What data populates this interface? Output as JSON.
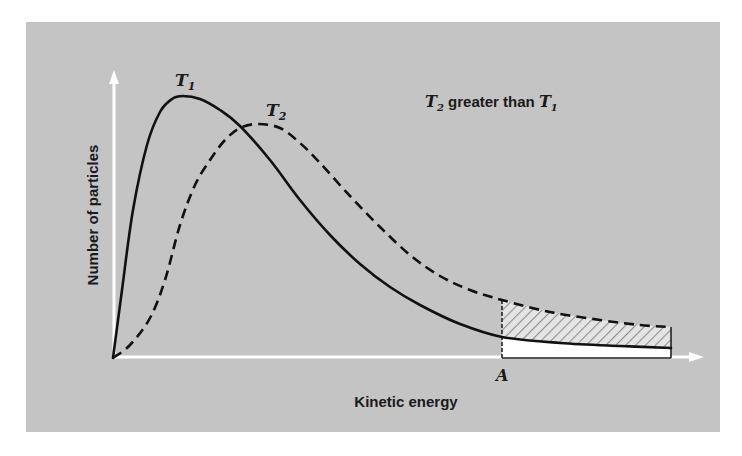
{
  "chart_data": {
    "type": "line",
    "title": "",
    "xlabel": "Kinetic energy",
    "ylabel": "Number of particles",
    "annotation": {
      "t2_label": "T",
      "t2_sub": "2",
      "middle": " greater than ",
      "t1_label": "T",
      "t1_sub": "1"
    },
    "x_marker": {
      "label": "A",
      "description": "Energy threshold; shaded region to the right shows extra high-energy particles at T2"
    },
    "grid": false,
    "legend": "inline labels on curves",
    "axis_ticks": "none",
    "background_color": "#c4c4c4",
    "series": [
      {
        "name": "T1",
        "label_main": "T",
        "label_sub": "1",
        "style": "solid",
        "color": "#111111",
        "points_px": [
          [
            113,
            358
          ],
          [
            122,
            290
          ],
          [
            133,
            210
          ],
          [
            147,
            145
          ],
          [
            160,
            112
          ],
          [
            172,
            99
          ],
          [
            183,
            96
          ],
          [
            200,
            99
          ],
          [
            220,
            110
          ],
          [
            240,
            126
          ],
          [
            270,
            160
          ],
          [
            300,
            200
          ],
          [
            330,
            235
          ],
          [
            360,
            264
          ],
          [
            390,
            287
          ],
          [
            420,
            305
          ],
          [
            460,
            324
          ],
          [
            502,
            337
          ],
          [
            560,
            343
          ],
          [
            620,
            346
          ],
          [
            671,
            348
          ]
        ]
      },
      {
        "name": "T2",
        "label_main": "T",
        "label_sub": "2",
        "style": "dashed",
        "color": "#111111",
        "points_px": [
          [
            113,
            358
          ],
          [
            130,
            345
          ],
          [
            150,
            318
          ],
          [
            165,
            280
          ],
          [
            180,
            225
          ],
          [
            195,
            185
          ],
          [
            210,
            160
          ],
          [
            225,
            140
          ],
          [
            240,
            128
          ],
          [
            258,
            124
          ],
          [
            280,
            128
          ],
          [
            300,
            143
          ],
          [
            320,
            163
          ],
          [
            350,
            196
          ],
          [
            380,
            227
          ],
          [
            410,
            255
          ],
          [
            440,
            276
          ],
          [
            470,
            290
          ],
          [
            502,
            300
          ],
          [
            550,
            312
          ],
          [
            600,
            320
          ],
          [
            640,
            325
          ],
          [
            671,
            327
          ]
        ]
      }
    ],
    "shaded_region": {
      "x_from_px": 502,
      "x_to_px": 671,
      "pattern": "diagonal hatch between T1 and T2 curves",
      "below_T1": "white fill"
    }
  }
}
